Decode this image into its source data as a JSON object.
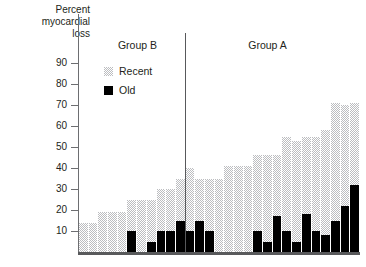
{
  "figure": {
    "axis_title_lines": [
      "Percent",
      "myocardial",
      "loss"
    ],
    "axis_title_full": "Percent myocardial loss"
  },
  "legend": {
    "position": "upper-left-inside",
    "items": [
      {
        "label": "Recent",
        "swatch": "recent-swatch",
        "color": "#bcbdc0"
      },
      {
        "label": "Old",
        "swatch": "old-swatch",
        "color": "#000000"
      }
    ]
  },
  "groups": [
    {
      "name": "Group B",
      "label": "Group B"
    },
    {
      "name": "Group A",
      "label": "Group A"
    }
  ],
  "chart_data": {
    "type": "bar",
    "title": "",
    "subtitle": "",
    "xlabel": "",
    "ylabel": "Percent myocardial loss",
    "ylim": [
      0,
      95
    ],
    "yticks": [
      10,
      20,
      30,
      40,
      50,
      60,
      70,
      80,
      90
    ],
    "ytick_labels": [
      "10",
      "20",
      "30",
      "40",
      "50",
      "60",
      "70",
      "80",
      "90"
    ],
    "grid": false,
    "stacked": true,
    "legend_entries": [
      "Recent",
      "Old"
    ],
    "annotations": [
      "Group B",
      "Group A"
    ],
    "group_divider_after_index": 12,
    "series": [
      {
        "name": "Old",
        "values": [
          0,
          0,
          0,
          0,
          0,
          10,
          0,
          5,
          10,
          10,
          15,
          10,
          15,
          10,
          0,
          0,
          0,
          0,
          10,
          5,
          17,
          10,
          5,
          18,
          10,
          8,
          15,
          22,
          32
        ]
      },
      {
        "name": "Recent",
        "values": [
          14,
          14,
          19,
          19,
          19,
          15,
          25,
          20,
          20,
          20,
          20,
          30,
          20,
          25,
          35,
          41,
          41,
          41,
          36,
          41,
          29,
          45,
          48,
          37,
          45,
          50,
          56,
          48,
          39
        ]
      }
    ],
    "totals": [
      14,
      14,
      19,
      19,
      19,
      25,
      25,
      25,
      30,
      30,
      35,
      40,
      35,
      35,
      35,
      41,
      41,
      41,
      46,
      46,
      46,
      55,
      53,
      55,
      55,
      58,
      71,
      70,
      71
    ],
    "group_assignment": [
      "Group B",
      "Group B",
      "Group B",
      "Group B",
      "Group B",
      "Group B",
      "Group B",
      "Group B",
      "Group B",
      "Group B",
      "Group B",
      "Group B",
      "Group B",
      "Group A",
      "Group A",
      "Group A",
      "Group A",
      "Group A",
      "Group A",
      "Group A",
      "Group A",
      "Group A",
      "Group A",
      "Group A",
      "Group A",
      "Group A",
      "Group A",
      "Group A",
      "Group A"
    ]
  }
}
